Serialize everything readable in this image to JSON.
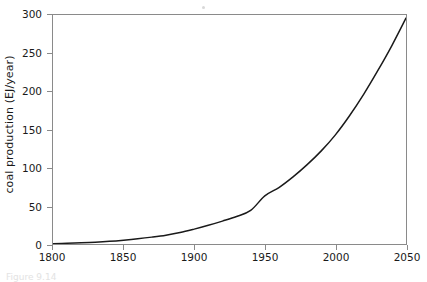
{
  "figure": {
    "caption": "Figure 9.14",
    "background_color": "#ffffff",
    "frame_color": "#8a8a8a",
    "curve_color": "#1a1a1a"
  },
  "chart_data": {
    "type": "line",
    "title": "",
    "subtitle": "",
    "xlabel": "",
    "ylabel": "coal production (EJ/year)",
    "xlim": [
      1800,
      2050
    ],
    "ylim": [
      0,
      300
    ],
    "xticks": [
      1800,
      1850,
      1900,
      1950,
      2000,
      2050
    ],
    "yticks": [
      0,
      50,
      100,
      150,
      200,
      250,
      300
    ],
    "xtick_labels": [
      "1800",
      "1850",
      "1900",
      "1950",
      "2000",
      "2050"
    ],
    "ytick_labels": [
      "0",
      "50",
      "100",
      "150",
      "200",
      "250",
      "300"
    ],
    "grid": false,
    "legend": null,
    "legend_position": "none",
    "annotations": [],
    "series": [
      {
        "name": "coal production",
        "color": "#1a1a1a",
        "line_width": 1.5,
        "x": [
          1800,
          1810,
          1820,
          1830,
          1840,
          1850,
          1860,
          1870,
          1880,
          1890,
          1900,
          1910,
          1920,
          1930,
          1940,
          1950,
          1960,
          1970,
          1980,
          1990,
          2000,
          2010,
          2020,
          2030,
          2040,
          2050
        ],
        "values": [
          0.5,
          1.0,
          1.6,
          2.4,
          3.5,
          5.0,
          6.8,
          9.0,
          11.6,
          15.0,
          19.5,
          24.5,
          30.0,
          36.0,
          44.0,
          63.0,
          74.0,
          88.0,
          104.0,
          122.0,
          143.0,
          168.0,
          196.0,
          227.0,
          260.0,
          296.0
        ]
      }
    ]
  }
}
